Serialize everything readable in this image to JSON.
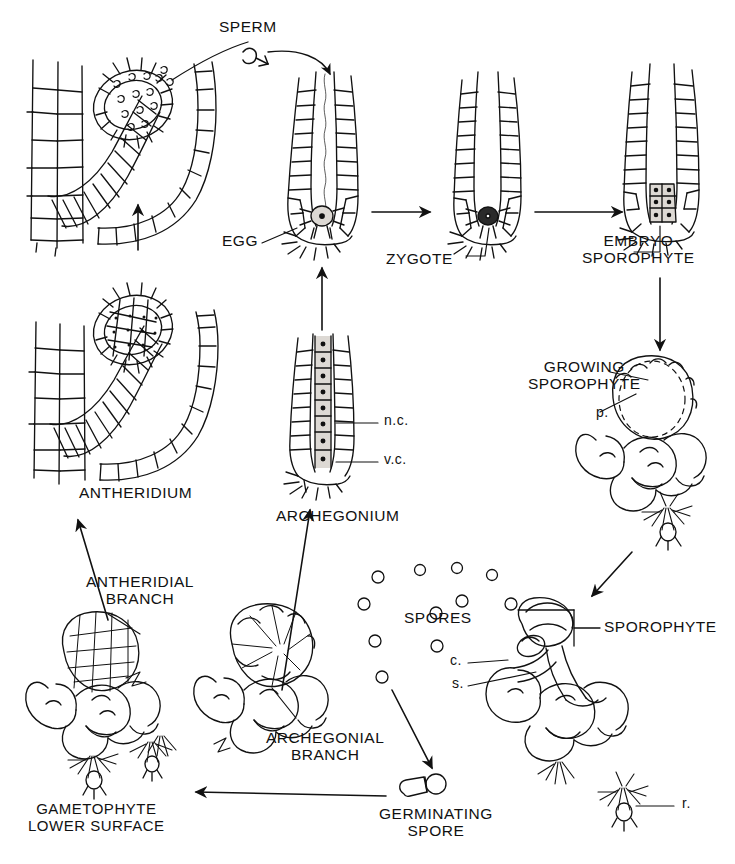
{
  "diagram": {
    "type": "biological-life-cycle-diagram",
    "line_color": "#111111",
    "background": "#ffffff"
  },
  "labels": {
    "sperm": "SPERM",
    "egg": "EGG",
    "zygote": "ZYGOTE",
    "embryo_sporophyte": "EMBRYO\nSPOROPHYTE",
    "growing_sporophyte": "GROWING\nSPOROPHYTE",
    "antheridium": "ANTHERIDIUM",
    "archegonium": "ARCHEGONIUM",
    "neck_canal": "n.c.",
    "ventral_canal": "v.c.",
    "placenta": "p.",
    "antheridial_branch": "ANTHERIDIAL\nBRANCH",
    "archegonial_branch": "ARCHEGONIAL\nBRANCH",
    "gametophyte_lower_surface": "GAMETOPHYTE\nLOWER SURFACE",
    "spores": "SPORES",
    "germinating_spore": "GERMINATING\nSPORE",
    "sporophyte": "SPOROPHYTE",
    "capsule": "c.",
    "seta": "s.",
    "rhizoids": "r."
  },
  "stages": [
    {
      "id": "antheridium-dehiscing",
      "label": "SPERM"
    },
    {
      "id": "antheridium",
      "label": "ANTHERIDIUM"
    },
    {
      "id": "archegonium",
      "label": "ARCHEGONIUM"
    },
    {
      "id": "archegonium-egg",
      "label": "EGG"
    },
    {
      "id": "zygote",
      "label": "ZYGOTE"
    },
    {
      "id": "embryo",
      "label": "EMBRYO SPOROPHYTE"
    },
    {
      "id": "growing-sporophyte",
      "label": "GROWING SPOROPHYTE"
    },
    {
      "id": "mature-sporophyte",
      "label": "SPOROPHYTE"
    },
    {
      "id": "spores",
      "label": "SPORES"
    },
    {
      "id": "germinating-spore",
      "label": "GERMINATING SPORE"
    },
    {
      "id": "gametophyte",
      "label": "GAMETOPHYTE LOWER SURFACE"
    }
  ],
  "annotations": [
    {
      "key": "n.c.",
      "meaning_position": "archegonium neck"
    },
    {
      "key": "v.c.",
      "meaning_position": "archegonium venter"
    },
    {
      "key": "p.",
      "meaning_position": "growing sporophyte foot"
    },
    {
      "key": "c.",
      "meaning_position": "sporophyte capsule"
    },
    {
      "key": "s.",
      "meaning_position": "sporophyte seta"
    },
    {
      "key": "r.",
      "meaning_position": "gametophyte rhizoids"
    }
  ]
}
